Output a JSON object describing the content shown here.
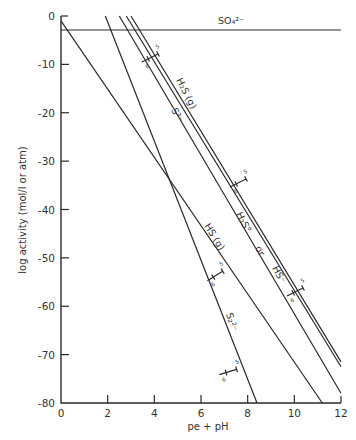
{
  "chart_data": {
    "type": "line",
    "title": "",
    "xlabel": "pe + pH",
    "ylabel": "log activity (mol/l or atm)",
    "xlim": [
      0,
      12
    ],
    "ylim": [
      -80,
      0
    ],
    "x_ticks": [
      0,
      2,
      4,
      6,
      8,
      10,
      12
    ],
    "y_ticks": [
      0,
      -10,
      -20,
      -30,
      -40,
      -50,
      -60,
      -70,
      -80
    ],
    "grid": false,
    "legend": "none (curves labeled inline)",
    "series": [
      {
        "name": "SO4 2-",
        "label": "SO₄²⁻",
        "x": [
          0,
          12
        ],
        "y": [
          -2.9,
          -2.9
        ]
      },
      {
        "name": "H2S (g) upper",
        "label": "H₂S (g)",
        "x": [
          3.0,
          12
        ],
        "y": [
          0,
          -71.5
        ]
      },
      {
        "name": "H2S (aq) or HS-",
        "label": "H₂S° or HS⁻",
        "x": [
          2.8,
          12
        ],
        "y": [
          0,
          -72.5
        ]
      },
      {
        "name": "S 2-",
        "label": "S²⁻",
        "x": [
          2.5,
          12
        ],
        "y": [
          0,
          -78
        ]
      },
      {
        "name": "HS (g)",
        "label": "HS (g)",
        "x": [
          0,
          11.2
        ],
        "y": [
          -1,
          -80
        ]
      },
      {
        "name": "S2 2-",
        "label": "S₂²⁻",
        "x": [
          1.9,
          8.4
        ],
        "y": [
          0,
          -80
        ]
      }
    ],
    "annotations": [
      {
        "text": "5 / 6 markers",
        "note": "small tick pairs labeled 5 and 6 across H2S(g) lines near pe+pH 3.8, 7.5, 10.2; on HS(g) near 7.8; on S2 2- near 7.8"
      }
    ]
  },
  "axis": {
    "x_title": "pe + pH",
    "y_title": "log activity (mol/l or atm)",
    "x_tick_labels": [
      "0",
      "2",
      "4",
      "6",
      "8",
      "10",
      "12"
    ],
    "y_tick_labels": [
      "0",
      "-10",
      "-20",
      "-30",
      "-40",
      "-50",
      "-60",
      "-70",
      "-80"
    ]
  },
  "labels": {
    "so4": "SO₄²⁻",
    "h2s_g": "H₂S (g)",
    "s2minus": "S²⁻",
    "h2s_aq": "H₂S°",
    "or": "or",
    "hs_minus": "HS⁻",
    "hs_g": "HS (g)",
    "s2_2minus": "S₂²⁻",
    "marker_5": "5",
    "marker_6": "6"
  }
}
